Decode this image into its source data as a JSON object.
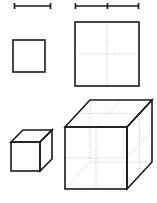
{
  "figure": {
    "background_color": "#ffffff",
    "edge_color": "#1a1a1a",
    "dotted_color": "#b4b4b4",
    "canvas": {
      "width": 157,
      "height": 203
    }
  },
  "shapes": {
    "small_segment": {
      "label": "small line segment",
      "dimension": "1D",
      "units": 1,
      "x1": 14,
      "y1": 6,
      "x2": 51,
      "y2": 6,
      "ticks": [
        14,
        51
      ]
    },
    "large_segment": {
      "label": "doubled line segment",
      "dimension": "1D",
      "units": 2,
      "x1": 75,
      "y1": 6,
      "x2": 139,
      "y2": 6,
      "ticks": [
        75,
        107,
        139
      ]
    },
    "small_square": {
      "label": "small square",
      "dimension": "2D",
      "units": 1,
      "x": 13,
      "y": 40,
      "size": 32
    },
    "large_square": {
      "label": "doubled square",
      "dimension": "2D",
      "units": 4,
      "x": 75,
      "y": 22,
      "size": 64,
      "midlines": true
    },
    "small_cube": {
      "label": "small cube",
      "dimension": "3D",
      "units": 1,
      "front_x": 11,
      "front_y": 142,
      "size": 29,
      "depth_x": 12,
      "depth_y": -12
    },
    "large_cube": {
      "label": "doubled cube",
      "dimension": "3D",
      "units": 8,
      "front_x": 65,
      "front_y": 127,
      "size": 62,
      "depth_x": 25,
      "depth_y": -27,
      "midlines": true,
      "hidden_edges": true
    }
  }
}
